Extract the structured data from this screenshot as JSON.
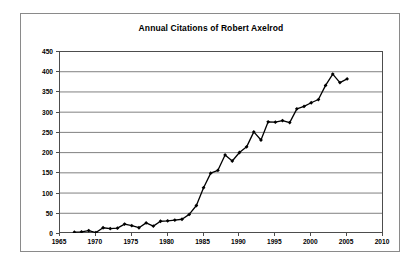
{
  "chart_data": {
    "type": "line",
    "title": "Annual Citations of Robert Axelrod",
    "xlabel": "",
    "ylabel": "",
    "xlim": [
      1965,
      2010
    ],
    "ylim": [
      0,
      450
    ],
    "ytick_step": 50,
    "xtick_step": 5,
    "grid": "horizontal",
    "legend": "none",
    "marker": "filled-diamond",
    "line_color": "#000000",
    "grid_color": "#808080",
    "yticks": [
      "0",
      "50",
      "100",
      "150",
      "200",
      "250",
      "300",
      "350",
      "400",
      "450"
    ],
    "xticks": [
      "1965",
      "1970",
      "1975",
      "1980",
      "1985",
      "1990",
      "1995",
      "2000",
      "2005",
      "2010"
    ],
    "x": [
      1967,
      1968,
      1969,
      1970,
      1971,
      1972,
      1973,
      1974,
      1975,
      1976,
      1977,
      1978,
      1979,
      1980,
      1981,
      1982,
      1983,
      1984,
      1985,
      1986,
      1987,
      1988,
      1989,
      1990,
      1991,
      1992,
      1993,
      1994,
      1995,
      1996,
      1997,
      1998,
      1999,
      2000,
      2001,
      2002,
      2003,
      2004,
      2005
    ],
    "values": [
      2,
      3,
      6,
      1,
      13,
      11,
      12,
      22,
      18,
      13,
      25,
      17,
      29,
      30,
      32,
      34,
      46,
      68,
      112,
      148,
      155,
      193,
      178,
      199,
      213,
      250,
      230,
      275,
      274,
      278,
      273,
      307,
      313,
      322,
      330,
      365,
      393,
      372,
      381
    ],
    "series_name": "Annual citations"
  },
  "chart": {
    "title": "Annual Citations of Robert Axelrod"
  }
}
